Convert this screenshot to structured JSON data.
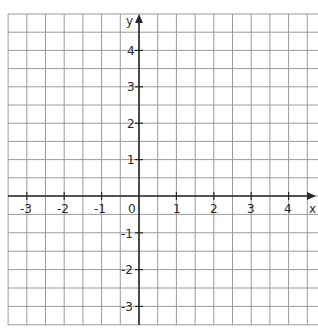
{
  "diagram": {
    "type": "coordinate-plane",
    "grid_color": "#9a9a9a",
    "axis_color": "#2a2a2a",
    "x_axis": {
      "label": "x",
      "ticks": [
        "-3",
        "-2",
        "-1",
        "1",
        "2",
        "3",
        "4"
      ],
      "tick_values": [
        -3,
        -2,
        -1,
        1,
        2,
        3,
        4
      ],
      "origin_label": "0"
    },
    "y_axis": {
      "label": "y",
      "ticks": [
        "4",
        "3",
        "2",
        "1",
        "-1",
        "-2",
        "-3"
      ],
      "tick_values": [
        4,
        3,
        2,
        1,
        -1,
        -2,
        -3
      ]
    },
    "grid": {
      "minor_per_unit": 2,
      "x_range": [
        -3.5,
        4.75
      ],
      "y_range": [
        -3.5,
        5
      ]
    }
  }
}
